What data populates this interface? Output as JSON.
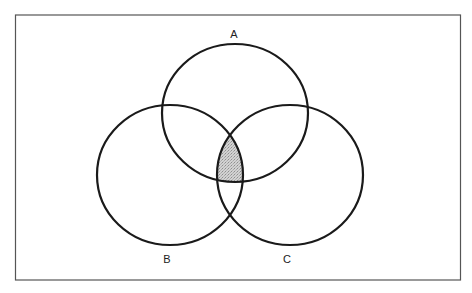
{
  "diagram": {
    "type": "venn",
    "sets": [
      {
        "id": "A",
        "label": "A"
      },
      {
        "id": "B",
        "label": "B"
      },
      {
        "id": "C",
        "label": "C"
      }
    ],
    "shaded_region": "A ∩ B ∩ C",
    "colors": {
      "stroke": "#1a1a1a",
      "shade": "#c4c4c4",
      "frame": "#555555",
      "background": "#ffffff"
    }
  }
}
